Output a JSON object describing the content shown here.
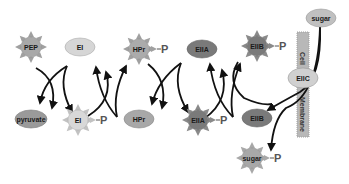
{
  "diagram": {
    "colors": {
      "light_fill": "#d6d6d6",
      "mid_fill": "#a8a8a8",
      "dark_fill": "#7a7a7a",
      "star_ray": "#9a9a9a",
      "membrane": "#b8b8b8",
      "arrow": "#111111",
      "phosphate": "#555555"
    },
    "nodes": {
      "pep": "PEP",
      "ei_top": "EI",
      "pyruvate": "pyruvate",
      "ei_p": "EI",
      "hpr_p": "HPr",
      "hpr": "HPr",
      "eiia_top": "EIIA",
      "eiia_p": "EIIA",
      "eiib_p": "EIIB",
      "eiib": "EIIB",
      "eiic": "EIIC",
      "sugar_out": "sugar",
      "sugar_p": "sugar"
    },
    "phosphate_label": "P",
    "membrane": {
      "label_top": "Cell",
      "label_bottom": "Membrane"
    }
  }
}
